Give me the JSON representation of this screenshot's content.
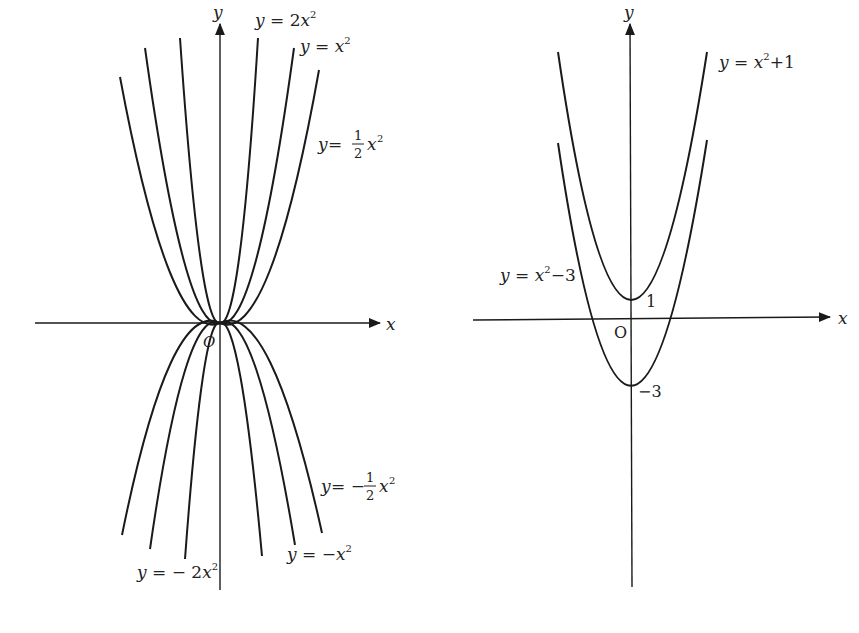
{
  "left_graph": {
    "axes": {
      "x_label": "x",
      "y_label": "y",
      "origin_label": "O"
    },
    "curves": [
      {
        "id": "2x2",
        "equation": "y = 2x²",
        "a": 2
      },
      {
        "id": "x2",
        "equation": "y = x²",
        "a": 1
      },
      {
        "id": "half_x2",
        "equation": "y = ½x²",
        "a": 0.5
      },
      {
        "id": "neg_half_x2",
        "equation": "y = −½x²",
        "a": -0.5
      },
      {
        "id": "neg_x2",
        "equation": "y = −x²",
        "a": -1
      },
      {
        "id": "neg_2x2",
        "equation": "y = −2x²",
        "a": -2
      }
    ],
    "labels": {
      "y2x2": {
        "y": "y",
        "eq": " = 2",
        "x": "x",
        "exp": "2"
      },
      "yx2": {
        "y": "y",
        "eq": " = ",
        "x": "x",
        "exp": "2"
      },
      "yhalf": {
        "y": "y",
        "eq": " = ",
        "num": "1",
        "den": "2",
        "x": "x",
        "exp": "2"
      },
      "yneghalf": {
        "y": "y",
        "eq": " = −",
        "num": "1",
        "den": "2",
        "x": "x",
        "exp": "2"
      },
      "ynegx2": {
        "y": "y",
        "eq": " = −",
        "x": "x",
        "exp": "2"
      },
      "yneg2x2": {
        "y": "y",
        "eq": " = − 2",
        "x": "x",
        "exp": "2"
      }
    }
  },
  "right_graph": {
    "axes": {
      "x_label": "x",
      "y_label": "y",
      "origin_label": "O"
    },
    "curves": [
      {
        "id": "x2_plus_1",
        "equation": "y = x² + 1",
        "vertex": [
          0,
          1
        ]
      },
      {
        "id": "x2_minus_3",
        "equation": "y = x² − 3",
        "vertex": [
          0,
          -3
        ]
      }
    ],
    "labels": {
      "plus1": {
        "y": "y",
        "eq": " = ",
        "x": "x",
        "exp": "2",
        "tail": "+1"
      },
      "minus3": {
        "y": "y",
        "eq": " = ",
        "x": "x",
        "exp": "2",
        "tail": "−3"
      },
      "vertex_plus1": "1",
      "vertex_minus3": "−3"
    }
  }
}
